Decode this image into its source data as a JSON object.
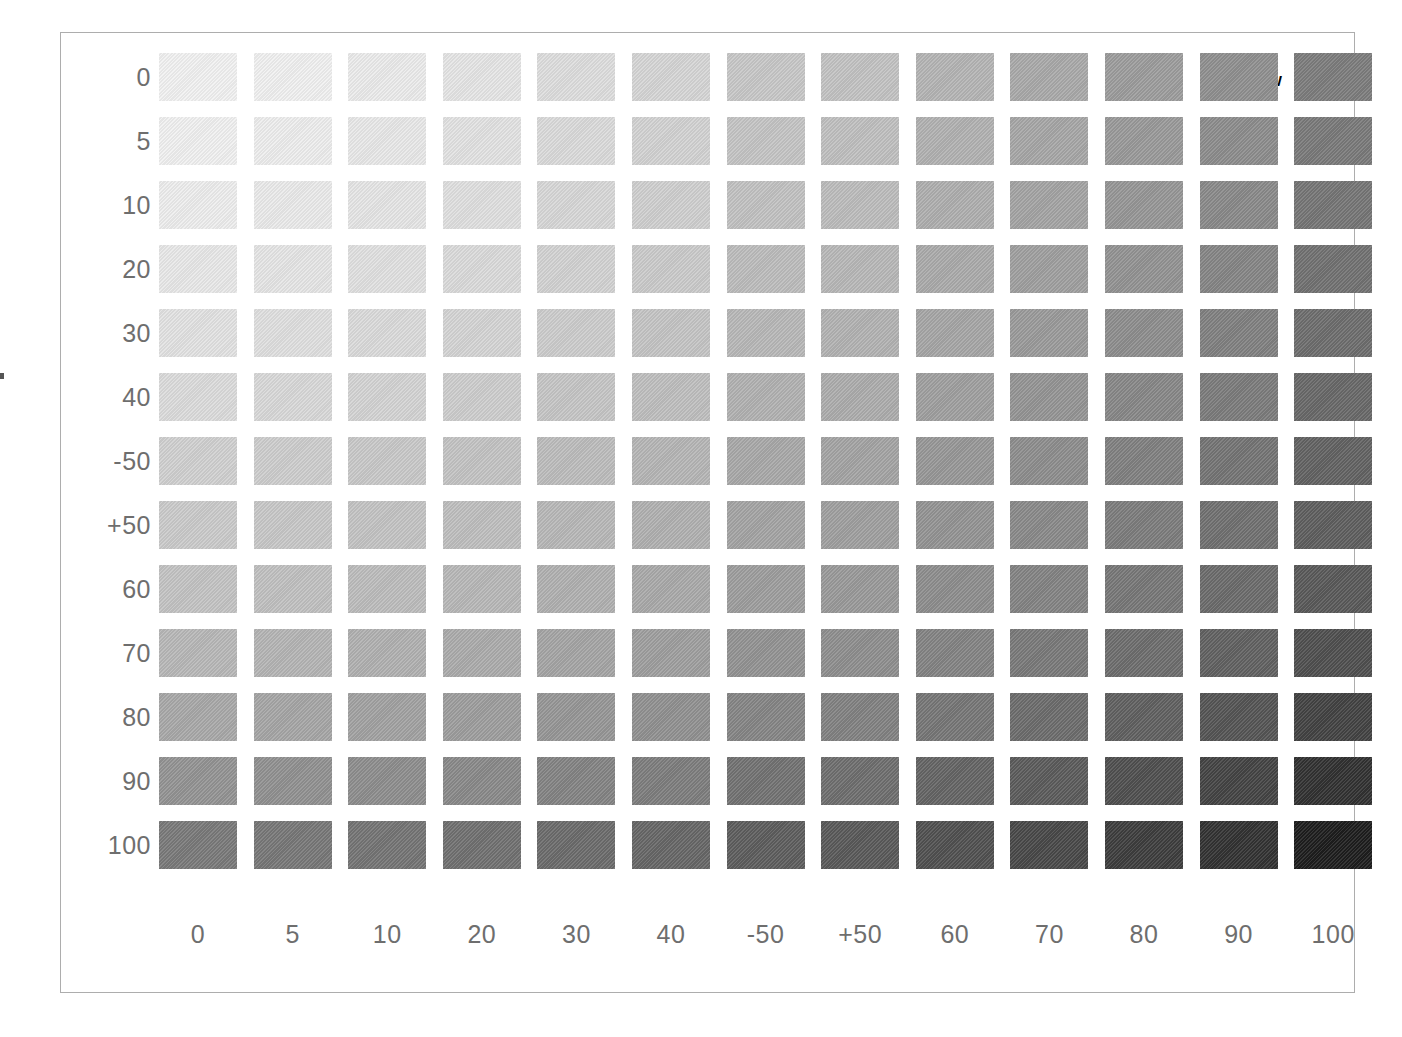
{
  "caption": {
    "primary": "60",
    "secondary": "YELLOW"
  },
  "edge_label": {
    "digit": "0",
    "rule": ""
  },
  "axes": {
    "row_labels": [
      "0",
      "5",
      "10",
      "20",
      "30",
      "40",
      "-50",
      "+50",
      "60",
      "70",
      "80",
      "90",
      "100"
    ],
    "column_labels": [
      "0",
      "5",
      "10",
      "20",
      "30",
      "40",
      "-50",
      "+50",
      "60",
      "70",
      "80",
      "90",
      "100"
    ]
  },
  "chart_data": {
    "type": "heatmap",
    "title": "60 YELLOW",
    "xlabel": "",
    "ylabel": "",
    "grid": false,
    "legend": "none",
    "colorscale": "grayscale-tint",
    "categories": [
      "0",
      "5",
      "10",
      "20",
      "30",
      "40",
      "-50",
      "+50",
      "60",
      "70",
      "80",
      "90",
      "100"
    ],
    "row_categories": [
      "0",
      "5",
      "10",
      "20",
      "30",
      "40",
      "-50",
      "+50",
      "60",
      "70",
      "80",
      "90",
      "100"
    ],
    "rows": [
      {
        "label": "0",
        "colors": [
          "#f2f2f2",
          "#f1f1f1",
          "#ececec",
          "#e6e6e6",
          "#dedede",
          "#d6d6d6",
          "#c8c8c8",
          "#c3c3c3",
          "#b5b5b5",
          "#aaaaaa",
          "#9d9d9d",
          "#909090",
          "#7d7d7d"
        ]
      },
      {
        "label": "5",
        "colors": [
          "#f1f1f1",
          "#eeeeee",
          "#e9e9e9",
          "#e3e3e3",
          "#dbdbdb",
          "#d3d3d3",
          "#c5c5c5",
          "#c0c0c0",
          "#b2b2b2",
          "#a7a7a7",
          "#9a9a9a",
          "#8d8d8d",
          "#7a7a7a"
        ]
      },
      {
        "label": "10",
        "colors": [
          "#eeeeee",
          "#ebebeb",
          "#e6e6e6",
          "#e0e0e0",
          "#d8d8d8",
          "#d0d0d0",
          "#c2c2c2",
          "#bdbdbd",
          "#afafaf",
          "#a4a4a4",
          "#979797",
          "#8a8a8a",
          "#767676"
        ]
      },
      {
        "label": "20",
        "colors": [
          "#e9e9e9",
          "#e6e6e6",
          "#e1e1e1",
          "#dbdbdb",
          "#d3d3d3",
          "#cbcbcb",
          "#bdbdbd",
          "#b8b8b8",
          "#ababab",
          "#a0a0a0",
          "#939393",
          "#868686",
          "#727272"
        ]
      },
      {
        "label": "30",
        "colors": [
          "#e3e3e3",
          "#e0e0e0",
          "#dbdbdb",
          "#d5d5d5",
          "#cdcdcd",
          "#c5c5c5",
          "#b8b8b8",
          "#b3b3b3",
          "#a6a6a6",
          "#9b9b9b",
          "#8e8e8e",
          "#818181",
          "#6e6e6e"
        ]
      },
      {
        "label": "40",
        "colors": [
          "#dcdcdc",
          "#d9d9d9",
          "#d4d4d4",
          "#cecece",
          "#c6c6c6",
          "#bfbfbf",
          "#b2b2b2",
          "#adadad",
          "#a0a0a0",
          "#959595",
          "#888888",
          "#7c7c7c",
          "#696969"
        ]
      },
      {
        "label": "-50",
        "colors": [
          "#d1d1d1",
          "#cecece",
          "#c9c9c9",
          "#c4c4c4",
          "#bdbdbd",
          "#b6b6b6",
          "#a9a9a9",
          "#a4a4a4",
          "#989898",
          "#8e8e8e",
          "#818181",
          "#757575",
          "#636363"
        ]
      },
      {
        "label": "+50",
        "colors": [
          "#cbcbcb",
          "#c8c8c8",
          "#c4c4c4",
          "#bfbfbf",
          "#b8b8b8",
          "#b1b1b1",
          "#a4a4a4",
          "#a0a0a0",
          "#949494",
          "#8a8a8a",
          "#7d7d7d",
          "#717171",
          "#5f5f5f"
        ]
      },
      {
        "label": "60",
        "colors": [
          "#c4c4c4",
          "#c1c1c1",
          "#bdbdbd",
          "#b8b8b8",
          "#b1b1b1",
          "#aaaaaa",
          "#9e9e9e",
          "#9a9a9a",
          "#8e8e8e",
          "#848484",
          "#787878",
          "#6c6c6c",
          "#5a5a5a"
        ]
      },
      {
        "label": "70",
        "colors": [
          "#b8b8b8",
          "#b5b5b5",
          "#b1b1b1",
          "#acacac",
          "#a5a5a5",
          "#9f9f9f",
          "#939393",
          "#8f8f8f",
          "#848484",
          "#7a7a7a",
          "#6e6e6e",
          "#626262",
          "#505050"
        ]
      },
      {
        "label": "80",
        "colors": [
          "#a9a9a9",
          "#a6a6a6",
          "#a2a2a2",
          "#9e9e9e",
          "#979797",
          "#919191",
          "#868686",
          "#828282",
          "#777777",
          "#6d6d6d",
          "#616161",
          "#555555",
          "#434343"
        ]
      },
      {
        "label": "90",
        "colors": [
          "#949494",
          "#919191",
          "#8e8e8e",
          "#8a8a8a",
          "#848484",
          "#7e7e7e",
          "#737373",
          "#6f6f6f",
          "#656565",
          "#5c5c5c",
          "#505050",
          "#444444",
          "#323232"
        ]
      },
      {
        "label": "100",
        "colors": [
          "#7a7a7a",
          "#787878",
          "#757575",
          "#717171",
          "#6c6c6c",
          "#676767",
          "#5e5e5e",
          "#5a5a5a",
          "#515151",
          "#494949",
          "#3e3e3e",
          "#333333",
          "#1e1e1e"
        ]
      }
    ]
  }
}
